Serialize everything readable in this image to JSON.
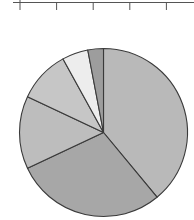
{
  "chart_data": {
    "type": "pie",
    "title": "",
    "labels": [
      "",
      "",
      "",
      "",
      "",
      ""
    ],
    "values": [
      39,
      29,
      14,
      10,
      5,
      3
    ],
    "colors": [
      "#b9b9b9",
      "#a7a7a7",
      "#bdbdbd",
      "#c6c6c6",
      "#ededed",
      "#9d9d9d"
    ],
    "start_angle_deg": 0,
    "direction": "clockwise",
    "stroke_color": "#3a3a3a",
    "legend": "none",
    "partial_axis": {
      "position": "top",
      "tick_count": 5,
      "tick_labels": []
    }
  }
}
